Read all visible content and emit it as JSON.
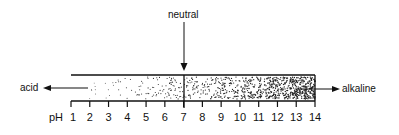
{
  "diagram": {
    "neutral_label": "neutral",
    "acid_label": "acid",
    "alkaline_label": "alkaline",
    "axis_label": "pH",
    "ticks": [
      "1",
      "2",
      "3",
      "4",
      "5",
      "6",
      "7",
      "8",
      "9",
      "10",
      "11",
      "12",
      "13",
      "14"
    ],
    "neutral_value": "7",
    "colors": {
      "ink": "#111111",
      "background": "#ffffff"
    }
  }
}
